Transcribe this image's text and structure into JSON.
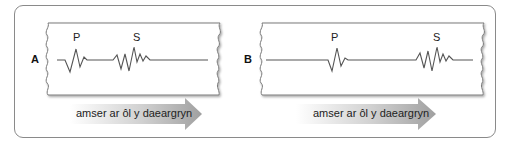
{
  "panels": [
    {
      "id": "A",
      "label": "A",
      "p_label": "P",
      "s_label": "S",
      "arrow_text": "amser ar ôl y daeargryn"
    },
    {
      "id": "B",
      "label": "B",
      "p_label": "P",
      "s_label": "S",
      "arrow_text": "amser ar ôl y daeargryn"
    }
  ],
  "colors": {
    "frame": "#8a8a8a",
    "strip_border": "#7a7a7a",
    "trace": "#555555",
    "arrow_dark": "#9a9a9a",
    "arrow_light": "#ffffff"
  }
}
